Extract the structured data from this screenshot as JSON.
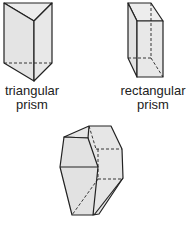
{
  "shapes": [
    {
      "name": "triangular prism",
      "label_line1": "triangular",
      "label_line2": "prism"
    },
    {
      "name": "rectangular prism",
      "label_line1": "rectangular",
      "label_line2": "prism"
    },
    {
      "name": "hexagonal prism",
      "label_line1": "",
      "label_line2": ""
    }
  ],
  "colors": {
    "face": "#e6e6e6",
    "face_light": "#ececec",
    "stroke": "#222222"
  }
}
